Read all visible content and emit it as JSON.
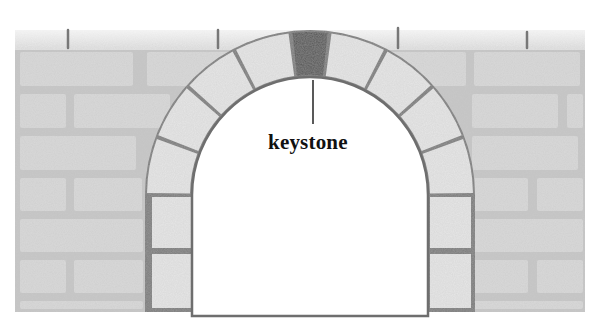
{
  "diagram": {
    "labels": [
      {
        "text": "keystone",
        "x": 268,
        "y": 131,
        "points_to": "keystone"
      }
    ],
    "colors": {
      "background": "#ffffff",
      "stone": "#d9d9d9",
      "stone_light": "#e6e6e6",
      "mortar": "#7a7a7a",
      "keystone": "#555555",
      "label": "#111111"
    },
    "arch": {
      "center_x": 310,
      "spring_y": 195,
      "inner_radius": 118,
      "outer_radius": 165,
      "voussoirs_per_side": 4
    }
  }
}
